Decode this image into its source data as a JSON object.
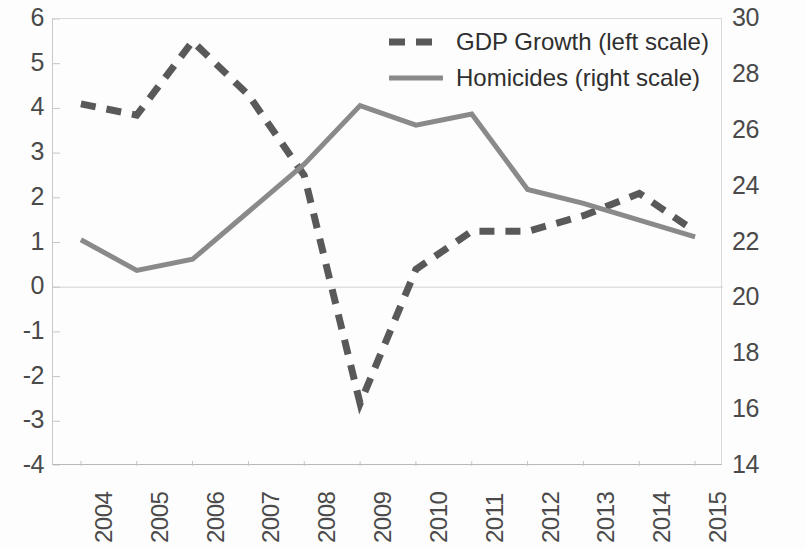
{
  "chart_data": {
    "type": "line",
    "title": "",
    "xlabel": "",
    "ylabel": "",
    "grid": false,
    "legend_position": "top-right",
    "categories": [
      "2004",
      "2005",
      "2006",
      "2007",
      "2008",
      "2009",
      "2010",
      "2011",
      "2012",
      "2013",
      "2014",
      "2015"
    ],
    "left_axis": {
      "label": "",
      "ticks": [
        "6",
        "5",
        "4",
        "3",
        "2",
        "1",
        "0",
        "-1",
        "-2",
        "-3",
        "-4"
      ],
      "tick_values": [
        6,
        5,
        4,
        3,
        2,
        1,
        0,
        -1,
        -2,
        -3,
        -4
      ],
      "ylim": [
        -4,
        6
      ]
    },
    "right_axis": {
      "label": "",
      "ticks": [
        "30",
        "28",
        "26",
        "24",
        "22",
        "20",
        "18",
        "16",
        "14"
      ],
      "tick_values": [
        30,
        28,
        26,
        24,
        22,
        20,
        18,
        16,
        14
      ],
      "ylim": [
        14,
        30
      ]
    },
    "series": [
      {
        "name": "GDP Growth (left scale)",
        "axis": "left",
        "style": "dashed",
        "color": "#595959",
        "values": [
          4.1,
          3.85,
          5.5,
          4.3,
          2.5,
          -2.6,
          0.4,
          1.25,
          1.25,
          1.6,
          2.1,
          1.25
        ]
      },
      {
        "name": "Homicides (right scale)",
        "axis": "right",
        "style": "solid",
        "color": "#8a8a8a",
        "values": [
          22.1,
          21.0,
          21.4,
          23.1,
          24.8,
          26.9,
          26.2,
          26.6,
          23.9,
          23.4,
          22.8,
          22.2
        ]
      }
    ]
  },
  "legend": {
    "items": [
      {
        "label": "GDP Growth (left scale)",
        "style": "dashed",
        "color": "#595959"
      },
      {
        "label": "Homicides (right scale)",
        "style": "solid",
        "color": "#8a8a8a"
      }
    ]
  }
}
